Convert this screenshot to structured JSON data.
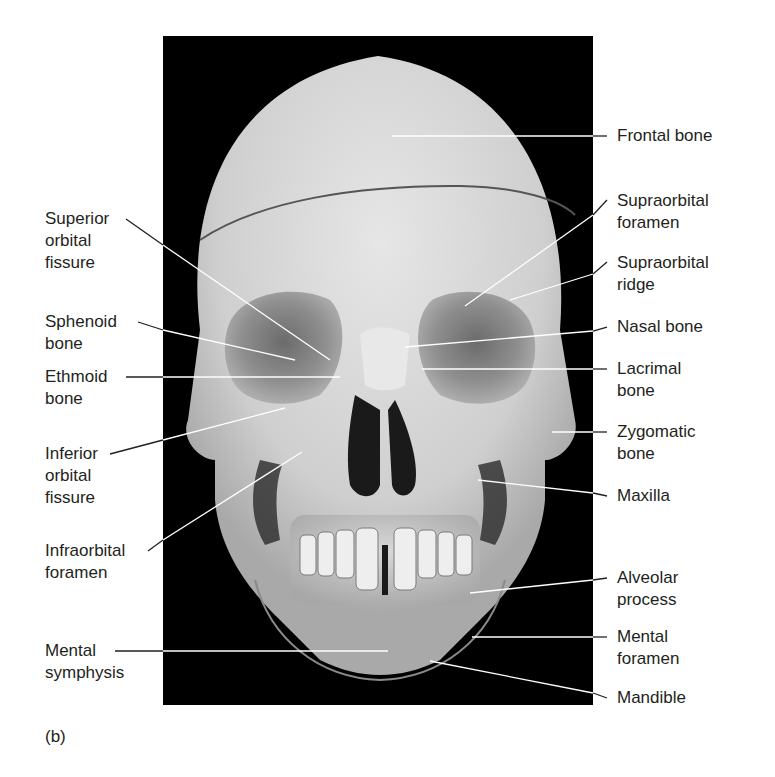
{
  "figure": {
    "panel_letter": "(b)",
    "colors": {
      "background": "#ffffff",
      "photo_background": "#000000",
      "bone": "#d9d9d9",
      "text": "#231f20",
      "leader_line": "#231f20",
      "leader_line_on_photo": "#ffffff"
    },
    "left_labels": [
      {
        "id": "superior-orbital-fissure",
        "lines": [
          "Superior",
          "orbital",
          "fissure"
        ]
      },
      {
        "id": "sphenoid-bone",
        "lines": [
          "Sphenoid",
          "bone"
        ]
      },
      {
        "id": "ethmoid-bone",
        "lines": [
          "Ethmoid",
          "bone"
        ]
      },
      {
        "id": "inferior-orbital-fissure",
        "lines": [
          "Inferior",
          "orbital",
          "fissure"
        ]
      },
      {
        "id": "infraorbital-foramen",
        "lines": [
          "Infraorbital",
          "foramen"
        ]
      },
      {
        "id": "mental-symphysis",
        "lines": [
          "Mental",
          "symphysis"
        ]
      }
    ],
    "right_labels": [
      {
        "id": "frontal-bone",
        "lines": [
          "Frontal bone"
        ]
      },
      {
        "id": "supraorbital-foramen",
        "lines": [
          "Supraorbital",
          "foramen"
        ]
      },
      {
        "id": "supraorbital-ridge",
        "lines": [
          "Supraorbital",
          "ridge"
        ]
      },
      {
        "id": "nasal-bone",
        "lines": [
          "Nasal bone"
        ]
      },
      {
        "id": "lacrimal-bone",
        "lines": [
          "Lacrimal",
          "bone"
        ]
      },
      {
        "id": "zygomatic-bone",
        "lines": [
          "Zygomatic",
          "bone"
        ]
      },
      {
        "id": "maxilla",
        "lines": [
          "Maxilla"
        ]
      },
      {
        "id": "alveolar-process",
        "lines": [
          "Alveolar",
          "process"
        ]
      },
      {
        "id": "mental-foramen",
        "lines": [
          "Mental",
          "foramen"
        ]
      },
      {
        "id": "mandible",
        "lines": [
          "Mandible"
        ]
      }
    ]
  }
}
